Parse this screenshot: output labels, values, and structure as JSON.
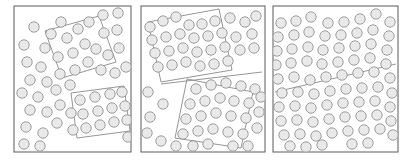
{
  "figure": {
    "title": "",
    "width": 406,
    "height": 161,
    "background_color": "#ffffff"
  },
  "style": {
    "panel_stroke_color": "#5a5a5a",
    "panel_fill_color": "#ffffff",
    "panel_stroke_width": 1,
    "region_stroke_color": "#8a8a8a",
    "region_stroke_width": 0.9,
    "circle_fill_color": "#e9e9e9",
    "circle_stroke_color": "#8e8e8e",
    "circle_stroke_width": 0.85,
    "circle_radius": 5.2
  },
  "panels": [
    {
      "id": "panel-1",
      "label": "",
      "frame": {
        "x": 14,
        "y": 6,
        "width": 117,
        "height": 146
      },
      "regions": [
        {
          "id": "region-1a",
          "label": "",
          "points": "45,31 99,16 116,62 62,78"
        },
        {
          "id": "region-1b",
          "label": "",
          "points": "71,93 124,86 130,131 77,138"
        }
      ],
      "dividers": [],
      "circles": [
        {
          "cx": 34,
          "cy": 27
        },
        {
          "cx": 51,
          "cy": 34
        },
        {
          "cx": 61,
          "cy": 22
        },
        {
          "cx": 24,
          "cy": 45
        },
        {
          "cx": 45,
          "cy": 48
        },
        {
          "cx": 67,
          "cy": 38
        },
        {
          "cx": 78,
          "cy": 29
        },
        {
          "cx": 89,
          "cy": 22
        },
        {
          "cx": 103,
          "cy": 15
        },
        {
          "cx": 118,
          "cy": 13
        },
        {
          "cx": 117,
          "cy": 30
        },
        {
          "cx": 104,
          "cy": 33
        },
        {
          "cx": 85,
          "cy": 44
        },
        {
          "cx": 73,
          "cy": 53
        },
        {
          "cx": 58,
          "cy": 57
        },
        {
          "cx": 27,
          "cy": 62
        },
        {
          "cx": 41,
          "cy": 67
        },
        {
          "cx": 96,
          "cy": 49
        },
        {
          "cx": 108,
          "cy": 55
        },
        {
          "cx": 119,
          "cy": 48
        },
        {
          "cx": 88,
          "cy": 62
        },
        {
          "cx": 75,
          "cy": 70
        },
        {
          "cx": 60,
          "cy": 74
        },
        {
          "cx": 47,
          "cy": 82
        },
        {
          "cx": 30,
          "cy": 80
        },
        {
          "cx": 22,
          "cy": 93
        },
        {
          "cx": 38,
          "cy": 97
        },
        {
          "cx": 56,
          "cy": 90
        },
        {
          "cx": 70,
          "cy": 85
        },
        {
          "cx": 101,
          "cy": 70
        },
        {
          "cx": 115,
          "cy": 73
        },
        {
          "cx": 126,
          "cy": 67
        },
        {
          "cx": 30,
          "cy": 110
        },
        {
          "cx": 47,
          "cy": 112
        },
        {
          "cx": 60,
          "cy": 105
        },
        {
          "cx": 26,
          "cy": 127
        },
        {
          "cx": 43,
          "cy": 133
        },
        {
          "cx": 57,
          "cy": 123
        },
        {
          "cx": 24,
          "cy": 144
        },
        {
          "cx": 40,
          "cy": 146
        },
        {
          "cx": 80,
          "cy": 100
        },
        {
          "cx": 95,
          "cy": 97
        },
        {
          "cx": 110,
          "cy": 94
        },
        {
          "cx": 122,
          "cy": 92
        },
        {
          "cx": 83,
          "cy": 114
        },
        {
          "cx": 98,
          "cy": 111
        },
        {
          "cx": 112,
          "cy": 108
        },
        {
          "cx": 125,
          "cy": 106
        },
        {
          "cx": 86,
          "cy": 128
        },
        {
          "cx": 100,
          "cy": 125
        },
        {
          "cx": 114,
          "cy": 122
        },
        {
          "cx": 127,
          "cy": 120
        },
        {
          "cx": 73,
          "cy": 130
        },
        {
          "cx": 71,
          "cy": 113
        },
        {
          "cx": 128,
          "cy": 137
        }
      ]
    },
    {
      "id": "panel-2",
      "label": "",
      "frame": {
        "x": 141,
        "y": 6,
        "width": 124,
        "height": 146
      },
      "regions": [
        {
          "id": "region-2a",
          "label": "",
          "points": "148,22 219,9 232,70 161,82"
        },
        {
          "id": "region-2b",
          "label": "",
          "points": "187,79 253,92 241,148 175,138"
        }
      ],
      "dividers": [
        {
          "x1": 161,
          "y1": 84,
          "x2": 262,
          "y2": 72
        }
      ],
      "circles": [
        {
          "cx": 150,
          "cy": 27
        },
        {
          "cx": 163,
          "cy": 21
        },
        {
          "cx": 176,
          "cy": 17
        },
        {
          "cx": 189,
          "cy": 25
        },
        {
          "cx": 202,
          "cy": 24
        },
        {
          "cx": 215,
          "cy": 21
        },
        {
          "cx": 230,
          "cy": 18
        },
        {
          "cx": 245,
          "cy": 22
        },
        {
          "cx": 256,
          "cy": 16
        },
        {
          "cx": 152,
          "cy": 40
        },
        {
          "cx": 166,
          "cy": 37
        },
        {
          "cx": 180,
          "cy": 34
        },
        {
          "cx": 194,
          "cy": 38
        },
        {
          "cx": 208,
          "cy": 36
        },
        {
          "cx": 222,
          "cy": 33
        },
        {
          "cx": 236,
          "cy": 37
        },
        {
          "cx": 252,
          "cy": 34
        },
        {
          "cx": 155,
          "cy": 53
        },
        {
          "cx": 169,
          "cy": 51
        },
        {
          "cx": 183,
          "cy": 48
        },
        {
          "cx": 197,
          "cy": 52
        },
        {
          "cx": 211,
          "cy": 50
        },
        {
          "cx": 225,
          "cy": 47
        },
        {
          "cx": 240,
          "cy": 50
        },
        {
          "cx": 254,
          "cy": 48
        },
        {
          "cx": 158,
          "cy": 67
        },
        {
          "cx": 172,
          "cy": 65
        },
        {
          "cx": 186,
          "cy": 62
        },
        {
          "cx": 200,
          "cy": 66
        },
        {
          "cx": 214,
          "cy": 64
        },
        {
          "cx": 228,
          "cy": 61
        },
        {
          "cx": 148,
          "cy": 92
        },
        {
          "cx": 163,
          "cy": 104
        },
        {
          "cx": 150,
          "cy": 117
        },
        {
          "cx": 147,
          "cy": 133
        },
        {
          "cx": 161,
          "cy": 141
        },
        {
          "cx": 176,
          "cy": 146
        },
        {
          "cx": 196,
          "cy": 89
        },
        {
          "cx": 211,
          "cy": 85
        },
        {
          "cx": 226,
          "cy": 83
        },
        {
          "cx": 241,
          "cy": 86
        },
        {
          "cx": 255,
          "cy": 89
        },
        {
          "cx": 190,
          "cy": 104
        },
        {
          "cx": 205,
          "cy": 101
        },
        {
          "cx": 220,
          "cy": 98
        },
        {
          "cx": 234,
          "cy": 101
        },
        {
          "cx": 249,
          "cy": 103
        },
        {
          "cx": 261,
          "cy": 97
        },
        {
          "cx": 186,
          "cy": 119
        },
        {
          "cx": 201,
          "cy": 116
        },
        {
          "cx": 216,
          "cy": 113
        },
        {
          "cx": 231,
          "cy": 116
        },
        {
          "cx": 246,
          "cy": 118
        },
        {
          "cx": 259,
          "cy": 112
        },
        {
          "cx": 183,
          "cy": 134
        },
        {
          "cx": 198,
          "cy": 131
        },
        {
          "cx": 213,
          "cy": 129
        },
        {
          "cx": 228,
          "cy": 132
        },
        {
          "cx": 243,
          "cy": 134
        },
        {
          "cx": 257,
          "cy": 128
        },
        {
          "cx": 193,
          "cy": 146
        },
        {
          "cx": 208,
          "cy": 144
        },
        {
          "cx": 233,
          "cy": 146
        },
        {
          "cx": 248,
          "cy": 146
        }
      ]
    },
    {
      "id": "panel-3",
      "label": "",
      "frame": {
        "x": 273,
        "y": 6,
        "width": 125,
        "height": 146
      },
      "regions": [],
      "dividers": [
        {
          "x1": 275,
          "y1": 92,
          "x2": 396,
          "y2": 64
        }
      ],
      "circles": [
        {
          "cx": 281,
          "cy": 23
        },
        {
          "cx": 296,
          "cy": 21
        },
        {
          "cx": 311,
          "cy": 17
        },
        {
          "cx": 328,
          "cy": 23
        },
        {
          "cx": 344,
          "cy": 22
        },
        {
          "cx": 360,
          "cy": 19
        },
        {
          "cx": 376,
          "cy": 14
        },
        {
          "cx": 390,
          "cy": 22
        },
        {
          "cx": 278,
          "cy": 37
        },
        {
          "cx": 294,
          "cy": 35
        },
        {
          "cx": 309,
          "cy": 32
        },
        {
          "cx": 325,
          "cy": 36
        },
        {
          "cx": 341,
          "cy": 35
        },
        {
          "cx": 357,
          "cy": 33
        },
        {
          "cx": 373,
          "cy": 30
        },
        {
          "cx": 389,
          "cy": 36
        },
        {
          "cx": 277,
          "cy": 51
        },
        {
          "cx": 292,
          "cy": 49
        },
        {
          "cx": 308,
          "cy": 47
        },
        {
          "cx": 323,
          "cy": 50
        },
        {
          "cx": 339,
          "cy": 48
        },
        {
          "cx": 355,
          "cy": 46
        },
        {
          "cx": 371,
          "cy": 44
        },
        {
          "cx": 387,
          "cy": 50
        },
        {
          "cx": 276,
          "cy": 65
        },
        {
          "cx": 291,
          "cy": 63
        },
        {
          "cx": 307,
          "cy": 61
        },
        {
          "cx": 322,
          "cy": 64
        },
        {
          "cx": 338,
          "cy": 62
        },
        {
          "cx": 354,
          "cy": 60
        },
        {
          "cx": 370,
          "cy": 58
        },
        {
          "cx": 386,
          "cy": 64
        },
        {
          "cx": 278,
          "cy": 79
        },
        {
          "cx": 294,
          "cy": 77
        },
        {
          "cx": 310,
          "cy": 80
        },
        {
          "cx": 326,
          "cy": 77
        },
        {
          "cx": 342,
          "cy": 75
        },
        {
          "cx": 358,
          "cy": 73
        },
        {
          "cx": 374,
          "cy": 72
        },
        {
          "cx": 390,
          "cy": 78
        },
        {
          "cx": 282,
          "cy": 93
        },
        {
          "cx": 298,
          "cy": 92
        },
        {
          "cx": 314,
          "cy": 94
        },
        {
          "cx": 330,
          "cy": 91
        },
        {
          "cx": 346,
          "cy": 89
        },
        {
          "cx": 362,
          "cy": 88
        },
        {
          "cx": 378,
          "cy": 87
        },
        {
          "cx": 392,
          "cy": 93
        },
        {
          "cx": 279,
          "cy": 107
        },
        {
          "cx": 295,
          "cy": 106
        },
        {
          "cx": 311,
          "cy": 108
        },
        {
          "cx": 327,
          "cy": 105
        },
        {
          "cx": 343,
          "cy": 103
        },
        {
          "cx": 359,
          "cy": 102
        },
        {
          "cx": 375,
          "cy": 101
        },
        {
          "cx": 390,
          "cy": 107
        },
        {
          "cx": 281,
          "cy": 121
        },
        {
          "cx": 297,
          "cy": 120
        },
        {
          "cx": 313,
          "cy": 122
        },
        {
          "cx": 329,
          "cy": 119
        },
        {
          "cx": 345,
          "cy": 117
        },
        {
          "cx": 361,
          "cy": 116
        },
        {
          "cx": 377,
          "cy": 115
        },
        {
          "cx": 391,
          "cy": 121
        },
        {
          "cx": 284,
          "cy": 135
        },
        {
          "cx": 300,
          "cy": 134
        },
        {
          "cx": 316,
          "cy": 136
        },
        {
          "cx": 332,
          "cy": 133
        },
        {
          "cx": 348,
          "cy": 131
        },
        {
          "cx": 364,
          "cy": 130
        },
        {
          "cx": 380,
          "cy": 129
        },
        {
          "cx": 393,
          "cy": 135
        },
        {
          "cx": 290,
          "cy": 146
        },
        {
          "cx": 306,
          "cy": 147
        },
        {
          "cx": 322,
          "cy": 145
        },
        {
          "cx": 352,
          "cy": 144
        },
        {
          "cx": 368,
          "cy": 143
        }
      ]
    }
  ]
}
